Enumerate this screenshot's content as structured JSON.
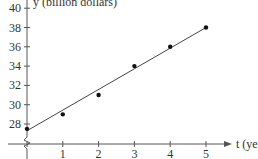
{
  "chart_data": {
    "type": "scatter",
    "title": "",
    "xlabel": "t (year)",
    "ylabel": "y (billion dollars)",
    "x": [
      0,
      1,
      2,
      3,
      4,
      5
    ],
    "series": [
      {
        "name": "data points",
        "values": [
          27.5,
          29,
          31,
          34,
          36,
          38
        ]
      },
      {
        "name": "trend line",
        "type": "line",
        "x": [
          0,
          5
        ],
        "values": [
          27.3,
          38
        ]
      }
    ],
    "x_ticks": [
      "0",
      "1",
      "2",
      "3",
      "4",
      "5"
    ],
    "y_ticks": [
      "28",
      "30",
      "32",
      "34",
      "36",
      "38",
      "40"
    ],
    "xlim": [
      0,
      5.5
    ],
    "ylim": [
      26,
      40.5
    ],
    "y_axis_break": true,
    "grid": false,
    "legend": "none",
    "colors": {
      "axis": "#555555",
      "line": "#444444",
      "points": "#111111"
    }
  },
  "labels": {
    "x_axis_title": "t (year)",
    "y_axis_title": "y (billion dollars)"
  }
}
